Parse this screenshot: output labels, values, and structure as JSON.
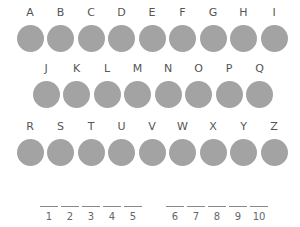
{
  "letter_rows": [
    [
      "A",
      "B",
      "C",
      "D",
      "E",
      "F",
      "G",
      "H",
      "I"
    ],
    [
      "J",
      "K",
      "L",
      "M",
      "N",
      "O",
      "P",
      "Q"
    ],
    [
      "R",
      "S",
      "T",
      "U",
      "V",
      "W",
      "X",
      "Y",
      "Z"
    ]
  ],
  "blanks": {
    "group1": [
      "1",
      "2",
      "3",
      "4",
      "5"
    ],
    "group2": [
      "6",
      "7",
      "8",
      "9",
      "10"
    ]
  },
  "colors": {
    "circle": "#a3a3a3",
    "text": "#555555"
  }
}
